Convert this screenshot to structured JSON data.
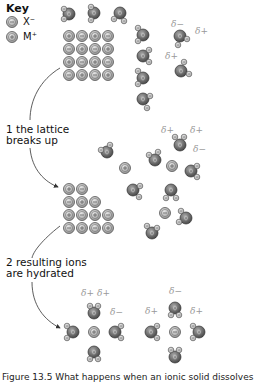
{
  "key": {
    "title": "Key",
    "items": [
      {
        "symbol": "−",
        "label": "X⁻",
        "name": "anion"
      },
      {
        "symbol": "+",
        "label": "M⁺",
        "name": "cation"
      }
    ]
  },
  "steps": [
    {
      "text": "1 the lattice breaks up"
    },
    {
      "text": "2 resulting ions are hydrated"
    }
  ],
  "delta_labels": {
    "minus": "δ−",
    "plus": "δ+"
  },
  "atom_labels": {
    "oxygen": "O",
    "hydrogen": "H"
  },
  "caption": "Figure 13.5 What happens when an ionic solid dissolves",
  "colors": {
    "ion_fill": "#b9b9b9",
    "ion_stroke": "#555555",
    "oxygen_fill": "#7a7a7a",
    "hydrogen_fill": "#d6d6d6",
    "delta_text": "#999999",
    "arrow": "#333333"
  },
  "lattice_initial": {
    "rows": [
      [
        "+",
        "−",
        "+",
        "−"
      ],
      [
        "−",
        "+",
        "−",
        "+"
      ],
      [
        "+",
        "−",
        "+",
        "−"
      ],
      [
        "−",
        "+",
        "−",
        "+"
      ]
    ]
  },
  "lattice_partial": {
    "rows": [
      [
        "+",
        "−"
      ],
      [
        "−",
        "+",
        "−"
      ],
      [
        "+",
        "−",
        "+",
        "−"
      ],
      [
        "−",
        "+",
        "−",
        "+"
      ]
    ]
  },
  "free_ions_step1": [
    "+",
    "+",
    "−"
  ],
  "hydrated_ions": [
    {
      "ion": "+",
      "water_count": 4
    },
    {
      "ion": "−",
      "water_count": 4
    }
  ]
}
